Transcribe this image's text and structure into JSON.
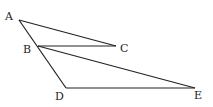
{
  "diagram": {
    "points": {
      "A": {
        "label": "A",
        "x": 19,
        "y": 20
      },
      "B": {
        "label": "B",
        "x": 38,
        "y": 46
      },
      "C": {
        "label": "C",
        "x": 116,
        "y": 46
      },
      "D": {
        "label": "D",
        "x": 66,
        "y": 88
      },
      "E": {
        "label": "E",
        "x": 195,
        "y": 88
      }
    },
    "segments": [
      "AC",
      "AD",
      "BC",
      "BE",
      "DE"
    ],
    "line_color": "#222222"
  }
}
